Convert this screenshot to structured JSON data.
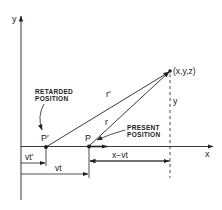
{
  "diagram": {
    "type": "retarded-position-geometry",
    "axes": {
      "x_label": "x",
      "y_label": "y"
    },
    "points": {
      "retarded": {
        "label": "P′",
        "annotation_line1": "RETARDED",
        "annotation_line2": "POSITION"
      },
      "present": {
        "label": "P",
        "annotation_line1": "PRESENT",
        "annotation_line2": "POSITION"
      },
      "field_point": {
        "label": "(x,y,z)"
      }
    },
    "vectors": {
      "r_prime": "r′",
      "r": "r"
    },
    "dimensions": {
      "vt_prime": "vt′",
      "vt": "vt",
      "x_minus_vt": "x−vt",
      "y": "y"
    },
    "colors": {
      "ink": "#222222",
      "background": "#ffffff"
    }
  }
}
